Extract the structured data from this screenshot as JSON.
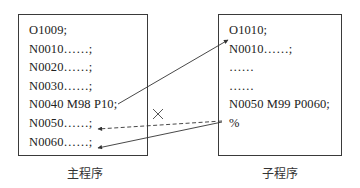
{
  "main_program": {
    "caption": "主程序",
    "lines": [
      "O1009;",
      "N0010……;",
      "N0020……;",
      "N0030……;",
      "N0040 M98 P10;",
      "N0050……;",
      "N0060……;"
    ]
  },
  "sub_program": {
    "caption": "子程序",
    "lines": [
      "O1010;",
      "N0010……;",
      "……",
      "……",
      "N0050 M99 P0060;",
      "%"
    ]
  },
  "connections": [
    {
      "from": "main.N0040 M98 P10",
      "to": "sub.N0010",
      "style": "solid",
      "label": "call"
    },
    {
      "from": "sub.N0050 M99 P0060",
      "to": "main.N0050",
      "style": "dashed",
      "crossed": true,
      "label": "default return (blocked)"
    },
    {
      "from": "sub.N0050 M99 P0060",
      "to": "main.N0060",
      "style": "solid",
      "label": "return to P0060"
    }
  ],
  "colors": {
    "line": "#333333",
    "border": "#3a3a3a",
    "text": "#222222"
  }
}
